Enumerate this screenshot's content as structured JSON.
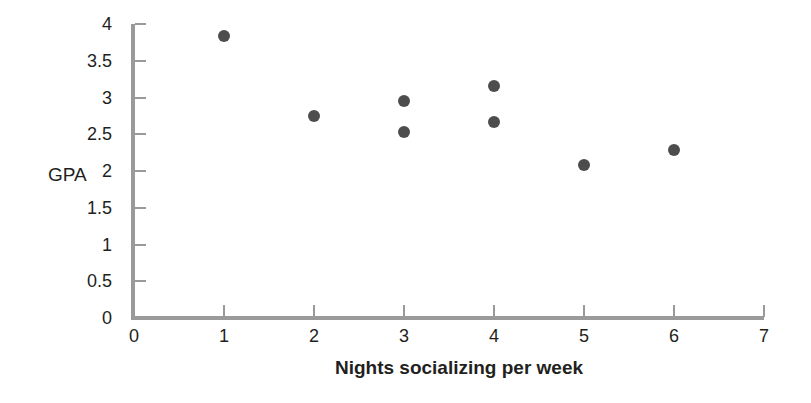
{
  "figure": {
    "background_color": "#ffffff",
    "width": 811,
    "height": 403
  },
  "style": {
    "point_color": "#4d4d4d",
    "axis_color": "#9a9a9a",
    "text_color": "#231f20"
  },
  "chart_data": {
    "type": "scatter",
    "title": "",
    "subtitle": "",
    "xlabel": "Nights socializing per week",
    "ylabel": "GPA",
    "xlim": [
      0,
      7
    ],
    "ylim": [
      0,
      4
    ],
    "xticks": [
      0,
      1,
      2,
      3,
      4,
      5,
      6,
      7
    ],
    "xtick_labels": [
      "0",
      "1",
      "2",
      "3",
      "4",
      "5",
      "6",
      "7"
    ],
    "yticks": [
      0,
      0.5,
      1,
      1.5,
      2,
      2.5,
      3,
      3.5,
      4
    ],
    "ytick_labels": [
      "0",
      "0.5",
      "1",
      "1.5",
      "2",
      "2.5",
      "3",
      "3.5",
      "4"
    ],
    "grid": false,
    "legend": null,
    "legend_position": "none",
    "annotations": [],
    "series": [
      {
        "name": "students",
        "marker": "circle",
        "color": "#4d4d4d",
        "points": [
          {
            "x": 1,
            "y": 3.83
          },
          {
            "x": 2,
            "y": 2.75
          },
          {
            "x": 3,
            "y": 2.95
          },
          {
            "x": 3,
            "y": 2.53
          },
          {
            "x": 4,
            "y": 3.15
          },
          {
            "x": 4,
            "y": 2.67
          },
          {
            "x": 5,
            "y": 2.08
          },
          {
            "x": 6,
            "y": 2.28
          }
        ]
      }
    ],
    "x": [
      1,
      2,
      3,
      3,
      4,
      4,
      5,
      6
    ],
    "y": [
      3.83,
      2.75,
      2.95,
      2.53,
      3.15,
      2.67,
      2.08,
      2.28
    ]
  }
}
